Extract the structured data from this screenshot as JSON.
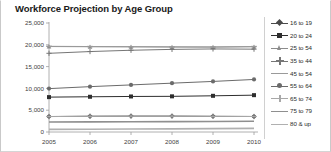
{
  "chart_title": "Workforce Projection by Age Group",
  "axis": {
    "y_ticks": [
      "0",
      "5,000",
      "10,000",
      "15,000",
      "20,000",
      "25,000"
    ],
    "x_ticks": [
      "2005",
      "2006",
      "2007",
      "2008",
      "2009",
      "2010"
    ]
  },
  "legend": {
    "items": [
      {
        "label": "16 to 19",
        "marker": "diamond",
        "color": "#4a4a4a"
      },
      {
        "label": "20 to 24",
        "marker": "square",
        "color": "#2e2e2e"
      },
      {
        "label": "25 to 54",
        "marker": "tri",
        "color": "#8c8c8c"
      },
      {
        "label": "35 to 44",
        "marker": "plus",
        "color": "#767676"
      },
      {
        "label": "45 to 54",
        "marker": "dash",
        "color": "#9a9a9a"
      },
      {
        "label": "55 to 64",
        "marker": "circle",
        "color": "#6b6b6b"
      },
      {
        "label": "65 to 74",
        "marker": "plus",
        "color": "#a8a8a8"
      },
      {
        "label": "75 to 79",
        "marker": "none",
        "color": "#8f8f8f"
      },
      {
        "label": "80 & up",
        "marker": "none",
        "color": "#b0b0b0"
      }
    ]
  },
  "chart_data": {
    "type": "line",
    "title": "Workforce Projection by Age Group",
    "xlabel": "",
    "ylabel": "",
    "categories": [
      "2005",
      "2006",
      "2007",
      "2008",
      "2009",
      "2010"
    ],
    "ylim": [
      0,
      25000
    ],
    "y_ticks": [
      0,
      5000,
      10000,
      15000,
      20000,
      25000
    ],
    "grid": false,
    "legend_position": "right",
    "series": [
      {
        "name": "16 to 19",
        "marker": "diamond",
        "color": "#4a4a4a",
        "values": [
          3550,
          3620,
          3650,
          3650,
          3600,
          3560
        ]
      },
      {
        "name": "20 to 24",
        "marker": "square",
        "color": "#2e2e2e",
        "values": [
          8000,
          8080,
          8150,
          8180,
          8300,
          8450
        ]
      },
      {
        "name": "25 to 54",
        "marker": "tri",
        "color": "#8c8c8c",
        "values": [
          19600,
          19560,
          19540,
          19500,
          19480,
          19550
        ]
      },
      {
        "name": "35 to 44",
        "marker": "plus",
        "color": "#767676",
        "values": [
          18050,
          18450,
          18750,
          18950,
          19050,
          19000
        ]
      },
      {
        "name": "45 to 54",
        "marker": "dash",
        "color": "#9a9a9a",
        "values": [
          19650,
          19600,
          19560,
          19520,
          19500,
          19600
        ]
      },
      {
        "name": "55 to 64",
        "marker": "circle",
        "color": "#6b6b6b",
        "values": [
          9950,
          10400,
          10800,
          11200,
          11600,
          12050
        ]
      },
      {
        "name": "65 to 74",
        "marker": "plus",
        "color": "#a8a8a8",
        "values": [
          3540,
          3600,
          3640,
          3640,
          3590,
          3550
        ]
      },
      {
        "name": "75 to 79",
        "marker": "none",
        "color": "#8f8f8f",
        "values": [
          2300,
          2320,
          2350,
          2380,
          2420,
          2450
        ]
      },
      {
        "name": "80 & up",
        "marker": "none",
        "color": "#b0b0b0",
        "values": [
          600,
          640,
          680,
          720,
          780,
          840
        ]
      }
    ]
  }
}
